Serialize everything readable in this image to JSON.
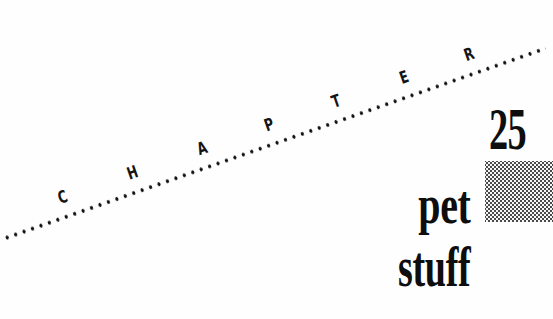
{
  "chapter_label": {
    "letters": [
      "C",
      "H",
      "A",
      "P",
      "T",
      "E",
      "R"
    ],
    "letter_offsets_px": [
      74,
      148,
      222,
      293,
      364,
      436,
      505
    ]
  },
  "chapter_number": "25",
  "title": {
    "line1": "pet",
    "line2": "stuff"
  },
  "colors": {
    "background": "#fefefe",
    "ink": "#0e0e0e",
    "halftone_dot": "#4a4a4a"
  }
}
